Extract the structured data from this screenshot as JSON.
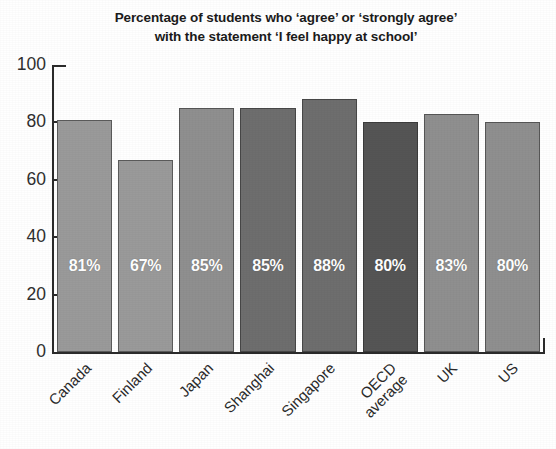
{
  "chart_data": {
    "type": "bar",
    "title": "Percentage of students who ‘agree’ or ‘strongly agree’ with the statement ‘I feel happy at school’",
    "title_line1": "Percentage of students who ‘agree’ or ‘strongly agree’",
    "title_line2": "with the statement ‘I feel happy at school’",
    "categories": [
      "Canada",
      "Finland",
      "Japan",
      "Shanghai",
      "Singapore",
      "OECD average",
      "UK",
      "US"
    ],
    "values": [
      81,
      67,
      85,
      85,
      88,
      80,
      83,
      80
    ],
    "data_labels": [
      "81%",
      "67%",
      "85%",
      "85%",
      "88%",
      "80%",
      "83%",
      "80%"
    ],
    "bar_colors": [
      "#9a9a9a",
      "#9a9a9a",
      "#8f8f8f",
      "#6e6e6e",
      "#6e6e6e",
      "#555555",
      "#8f8f8f",
      "#8f8f8f"
    ],
    "xlabel": "",
    "ylabel": "",
    "ylim": [
      0,
      100
    ],
    "yticks": [
      0,
      20,
      40,
      60,
      80,
      100
    ],
    "ytick_labels": [
      "0",
      "20",
      "40",
      "60",
      "80",
      "100"
    ],
    "grid": false,
    "legend": "none",
    "label_rotation": -45,
    "bars": [
      {
        "category": "Canada",
        "category_line1": "Canada",
        "category_line2": "",
        "value": 81,
        "label": "81%",
        "color": "#9a9a9a"
      },
      {
        "category": "Finland",
        "category_line1": "Finland",
        "category_line2": "",
        "value": 67,
        "label": "67%",
        "color": "#9a9a9a"
      },
      {
        "category": "Japan",
        "category_line1": "Japan",
        "category_line2": "",
        "value": 85,
        "label": "85%",
        "color": "#8f8f8f"
      },
      {
        "category": "Shanghai",
        "category_line1": "Shanghai",
        "category_line2": "",
        "value": 85,
        "label": "85%",
        "color": "#6e6e6e"
      },
      {
        "category": "Singapore",
        "category_line1": "Singapore",
        "category_line2": "",
        "value": 88,
        "label": "88%",
        "color": "#6e6e6e"
      },
      {
        "category": "OECD average",
        "category_line1": "OECD",
        "category_line2": "average",
        "value": 80,
        "label": "80%",
        "color": "#555555"
      },
      {
        "category": "UK",
        "category_line1": "UK",
        "category_line2": "",
        "value": 83,
        "label": "83%",
        "color": "#8f8f8f"
      },
      {
        "category": "US",
        "category_line1": "US",
        "category_line2": "",
        "value": 80,
        "label": "80%",
        "color": "#8f8f8f"
      }
    ]
  }
}
